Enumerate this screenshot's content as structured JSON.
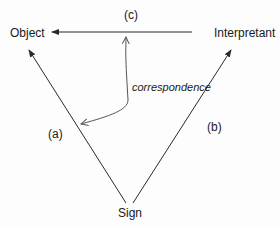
{
  "diagram": {
    "type": "semiotic-triangle",
    "nodes": {
      "object": "Object",
      "interpretant": "Interpretant",
      "sign": "Sign"
    },
    "edge_labels": {
      "a": "(a)",
      "b": "(b)",
      "c": "(c)",
      "correspondence": "correspondence"
    },
    "edges": [
      {
        "from": "Sign",
        "to": "Object",
        "label": "(a)"
      },
      {
        "from": "Sign",
        "to": "Interpretant",
        "label": "(b)"
      },
      {
        "from": "Interpretant",
        "to": "Object",
        "label": "(c)"
      },
      {
        "from": "(c)",
        "to": "(a)",
        "label": "correspondence",
        "style": "curved, bidirectional"
      }
    ],
    "colors": {
      "line": "#2a2a2a",
      "curve": "#555555",
      "text": "#1a1a1a"
    }
  }
}
